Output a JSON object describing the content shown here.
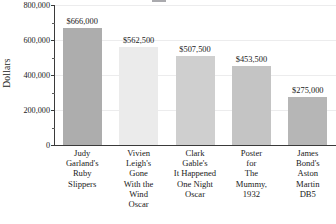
{
  "chart_data": {
    "type": "bar",
    "title": "",
    "xlabel": "",
    "ylabel": "Dollars",
    "ylim": [
      0,
      800000
    ],
    "grid": true,
    "legend": "none",
    "categories": [
      "Judy Garland's Ruby Slippers",
      "Vivien Leigh's Gone With the Wind Oscar",
      "Clark Gable's It Happened One Night Oscar",
      "Poster for The Mummy, 1932",
      "James Bond's Aston Martin DB5"
    ],
    "category_lines": [
      [
        "Judy",
        "Garland's",
        "Ruby",
        "Slippers"
      ],
      [
        "Vivien",
        "Leigh's",
        "Gone",
        "With the",
        "Wind",
        "Oscar"
      ],
      [
        "Clark",
        "Gable's",
        "It Happened",
        "One Night",
        "Oscar"
      ],
      [
        "Poster",
        "for",
        "The",
        "Mummy,",
        "1932"
      ],
      [
        "James",
        "Bond's",
        "Aston",
        "Martin",
        "DB5"
      ]
    ],
    "values": [
      666000,
      562500,
      507500,
      453500,
      275000
    ],
    "value_labels": [
      "$666,000",
      "$562,500",
      "$507,500",
      "$453,500",
      "$275,000"
    ],
    "bar_colors": [
      "#adadad",
      "#ebebeb",
      "#cfcfcf",
      "#c4c4c4",
      "#b6b6b6"
    ],
    "ytick_values": [
      0,
      200000,
      400000,
      600000,
      800000
    ],
    "ytick_labels": [
      "0",
      "200,000",
      "400,000",
      "600,000",
      "800,000"
    ],
    "yminor_values": [
      100000,
      300000,
      500000,
      700000
    ],
    "axis_color": "#3a3a3a",
    "grid_color": "#ececed",
    "text_color": "#1a1a1a"
  }
}
